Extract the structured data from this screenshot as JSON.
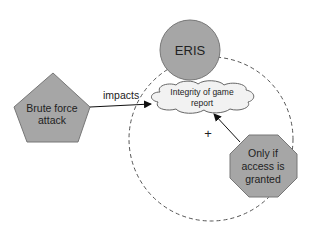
{
  "diagram": {
    "nodes": {
      "eris": {
        "label": "ERIS",
        "shape": "circle",
        "fill": "#a6a6a6"
      },
      "brute_force": {
        "label_line1": "Brute force",
        "label_line2": "attack",
        "shape": "pentagon",
        "fill": "#a6a6a6"
      },
      "integrity": {
        "label_line1": "Integrity of game",
        "label_line2": "report",
        "shape": "cloud",
        "fill": "#f2f2f2"
      },
      "access": {
        "label_line1": "Only if",
        "label_line2": "access is",
        "label_line3": "granted",
        "shape": "octagon",
        "fill": "#a6a6a6"
      }
    },
    "edges": {
      "impacts": {
        "label": "impacts",
        "from": "brute_force",
        "to": "integrity"
      },
      "condition": {
        "label": "",
        "from": "access",
        "to": "integrity"
      }
    },
    "markers": {
      "plus": "+"
    },
    "boundary": {
      "style": "dashed-circle",
      "stroke": "#555555"
    }
  }
}
